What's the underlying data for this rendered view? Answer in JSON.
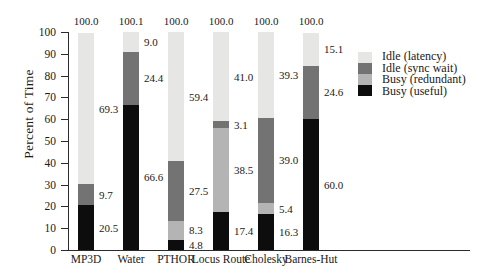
{
  "chart_data": {
    "type": "bar",
    "subtype": "stacked-bar",
    "title": "",
    "xlabel": "",
    "ylabel": "Percent of Time",
    "ylim": [
      0,
      100
    ],
    "yticks": [
      0,
      10,
      20,
      30,
      40,
      50,
      60,
      70,
      80,
      90,
      100
    ],
    "grid": false,
    "legend_position": "right",
    "categories": [
      "MP3D",
      "Water",
      "PTHOR",
      "Locus Route",
      "Cholesky",
      "Barnes-Hut"
    ],
    "series": [
      {
        "name": "Busy (useful)",
        "color": "#0d0d0d",
        "values": [
          20.5,
          66.6,
          4.8,
          17.4,
          16.3,
          60.0
        ]
      },
      {
        "name": "Busy (redundant)",
        "color": "#b4b4b4",
        "values": [
          0.0,
          0.0,
          8.3,
          38.5,
          5.4,
          0.0
        ]
      },
      {
        "name": "Idle (sync wait)",
        "color": "#737373",
        "values": [
          9.7,
          24.4,
          27.5,
          3.1,
          39.0,
          24.6
        ]
      },
      {
        "name": "Idle (latency)",
        "color": "#e6e6e4",
        "values": [
          69.3,
          9.0,
          59.4,
          41.0,
          39.3,
          15.1
        ]
      }
    ],
    "totals": [
      "100.0",
      "100.1",
      "100.0",
      "100.0",
      "100.0",
      "100.0"
    ],
    "bar_labels": [
      [
        {
          "text": "20.5",
          "value": 20.5
        },
        {
          "text": "9.7",
          "value": 9.7
        },
        {
          "text": "69.3",
          "value": 69.3
        }
      ],
      [
        {
          "text": "66.6",
          "value": 66.6
        },
        {
          "text": "24.4",
          "value": 24.4
        },
        {
          "text": "9.0",
          "value": 9.0
        }
      ],
      [
        {
          "text": "4.8",
          "value": 4.8
        },
        {
          "text": "8.3",
          "value": 8.3
        },
        {
          "text": "27.5",
          "value": 27.5
        },
        {
          "text": "59.4",
          "value": 59.4
        }
      ],
      [
        {
          "text": "17.4",
          "value": 17.4
        },
        {
          "text": "38.5",
          "value": 38.5
        },
        {
          "text": "3.1",
          "value": 3.1
        },
        {
          "text": "41.0",
          "value": 41.0
        }
      ],
      [
        {
          "text": "16.3",
          "value": 16.3
        },
        {
          "text": "5.4",
          "value": 5.4
        },
        {
          "text": "39.0",
          "value": 39.0
        },
        {
          "text": "39.3",
          "value": 39.3
        }
      ],
      [
        {
          "text": "60.0",
          "value": 60.0
        },
        {
          "text": "24.6",
          "value": 24.6
        },
        {
          "text": "15.1",
          "value": 15.1
        }
      ]
    ]
  },
  "axis": {
    "y_title": "Percent of Time",
    "y_tick_labels": [
      "100",
      "90",
      "80",
      "70",
      "60",
      "50",
      "40",
      "30",
      "20",
      "10",
      "0"
    ],
    "x_tick_labels": [
      "MP3D",
      "Water",
      "PTHOR",
      "Locus Route",
      "Cholesky",
      "Barnes-Hut"
    ]
  },
  "legend": {
    "entries": [
      {
        "label": "Idle (latency)",
        "color": "#e6e6e4"
      },
      {
        "label": "Idle (sync wait)",
        "color": "#737373"
      },
      {
        "label": "Busy (redundant)",
        "color": "#b4b4b4"
      },
      {
        "label": "Busy (useful)",
        "color": "#0d0d0d"
      }
    ]
  }
}
